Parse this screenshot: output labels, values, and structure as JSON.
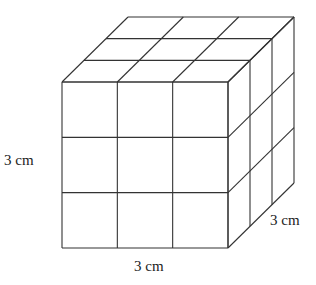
{
  "diagram": {
    "grid": 3,
    "labels": {
      "height": "3 cm",
      "width": "3 cm",
      "depth": "3 cm"
    },
    "line_color": "#333333",
    "geometry": {
      "front_x": 62,
      "front_y": 82,
      "size": 166,
      "depth_dx": 66,
      "depth_dy": -65
    }
  }
}
